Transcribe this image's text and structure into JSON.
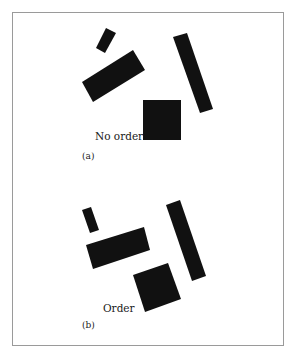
{
  "figure": {
    "panels": [
      {
        "id": "a",
        "caption": "No order",
        "panel_label": "(a)",
        "shapes": [
          {
            "name": "small-rectangle",
            "kind": "rectangle"
          },
          {
            "name": "wide-rectangle",
            "kind": "rectangle"
          },
          {
            "name": "tall-rectangle",
            "kind": "rectangle"
          },
          {
            "name": "square",
            "kind": "square"
          }
        ]
      },
      {
        "id": "b",
        "caption": "Order",
        "panel_label": "(b)",
        "shapes": [
          {
            "name": "small-rectangle",
            "kind": "rectangle"
          },
          {
            "name": "wide-rectangle",
            "kind": "rectangle"
          },
          {
            "name": "tall-rectangle",
            "kind": "rectangle"
          },
          {
            "name": "square",
            "kind": "square"
          }
        ]
      }
    ],
    "colors": {
      "shape": "#111111",
      "frame": "#9a9a9a",
      "background": "#ffffff"
    }
  }
}
